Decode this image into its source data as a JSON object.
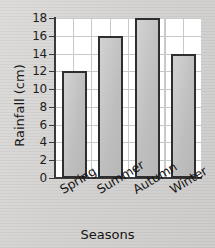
{
  "chart_data": {
    "type": "bar",
    "title": "",
    "categories": [
      "Spring",
      "Summer",
      "Autumn",
      "Winter"
    ],
    "values": [
      12,
      16,
      18,
      14
    ],
    "series": [
      {
        "name": "Rainfall",
        "values": [
          12,
          16,
          18,
          14
        ]
      }
    ],
    "xlabel": "Seasons",
    "ylabel": "Rainfall (cm)",
    "ylim": [
      0,
      18
    ],
    "ytick_step": 2,
    "yticks": [
      0,
      2,
      4,
      6,
      8,
      10,
      12,
      14,
      16,
      18
    ],
    "ytick_labels": [
      "0",
      "2",
      "4",
      "6",
      "8",
      "10",
      "12",
      "14",
      "16",
      "18"
    ],
    "grid": true,
    "legend": false,
    "legend_position": "none",
    "xtick_label_rotation": -31,
    "colors": {
      "bar_fill": "#c6c6c6",
      "bar_border": "#2e2e2e",
      "plot_background": "#ffffff",
      "grid_line": "#c9c9c9",
      "axis_line": "#3a3a3a",
      "page_background": "#d6d4d2",
      "text": "#151515"
    }
  }
}
